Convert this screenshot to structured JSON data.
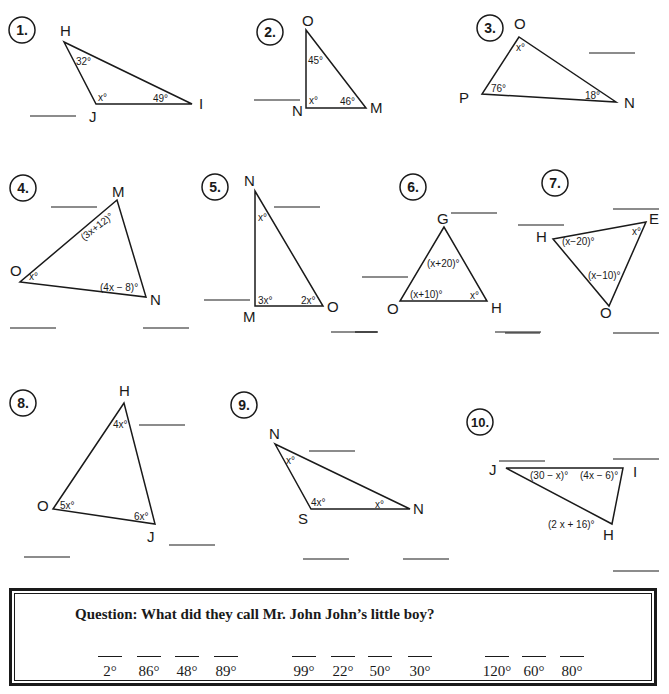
{
  "problems": [
    {
      "number": "1.",
      "vertices": [
        "H",
        "J",
        "I"
      ],
      "angles": {
        "H": "32°",
        "J": "x°",
        "I": "49°"
      }
    },
    {
      "number": "2.",
      "vertices": [
        "O",
        "N",
        "M"
      ],
      "angles": {
        "O": "45°",
        "N": "x°",
        "M": "46°"
      }
    },
    {
      "number": "3.",
      "vertices": [
        "O",
        "P",
        "N"
      ],
      "angles": {
        "O": "x°",
        "P": "76°",
        "N": "18°"
      }
    },
    {
      "number": "4.",
      "vertices": [
        "M",
        "O",
        "N"
      ],
      "angles": {
        "M": "(3x+12)°",
        "O": "x°",
        "N": "(4x − 8)°"
      }
    },
    {
      "number": "5.",
      "vertices": [
        "N",
        "M",
        "O"
      ],
      "angles": {
        "N": "x°",
        "M": "3x°",
        "O": "2x°"
      }
    },
    {
      "number": "6.",
      "vertices": [
        "G",
        "O",
        "H"
      ],
      "angles": {
        "G": "(x+20)°",
        "O": "(x+10)°",
        "H": "x°"
      }
    },
    {
      "number": "7.",
      "vertices": [
        "H",
        "E",
        "O"
      ],
      "angles": {
        "H": "(x−20)°",
        "E": "x°",
        "O": "(x−10)°"
      }
    },
    {
      "number": "8.",
      "vertices": [
        "H",
        "O",
        "J"
      ],
      "angles": {
        "H": "4x°",
        "O": "5x°",
        "J": "6x°"
      }
    },
    {
      "number": "9.",
      "vertices": [
        "N",
        "S",
        "N"
      ],
      "angles": {
        "N_top": "x°",
        "S": "4x°",
        "N_right": "x°"
      }
    },
    {
      "number": "10.",
      "vertices": [
        "J",
        "I",
        "H"
      ],
      "angles": {
        "J": "(30 − x)°",
        "I": "(4x − 6)°",
        "H": "(2 x + 16)°"
      }
    }
  ],
  "riddle": {
    "question": "Question:  What did they call Mr. John John’s little boy?",
    "answers": [
      "2°",
      "86°",
      "48°",
      "89°",
      "99°",
      "22°",
      "50°",
      "30°",
      "120°",
      "60°",
      "80°"
    ]
  }
}
